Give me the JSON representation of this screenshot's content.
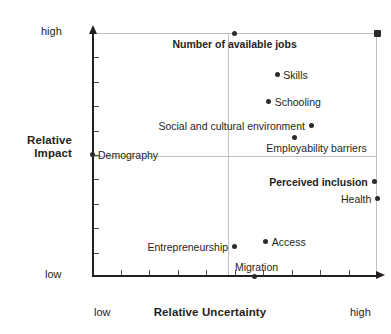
{
  "chart_data": {
    "type": "scatter",
    "title": "",
    "xlabel": "Relative Uncertainty",
    "ylabel": "Relative Impact",
    "xlim": [
      0,
      100
    ],
    "ylim": [
      0,
      100
    ],
    "x_tick_labels": [
      "low",
      "high"
    ],
    "y_tick_labels": [
      "low",
      "high"
    ],
    "grid": "quadrant-midlines",
    "legend": "none",
    "points": [
      {
        "label": "Number of available jobs",
        "x": 50,
        "y": 100,
        "bold": true,
        "label_pos": "below-center",
        "marker": "dot"
      },
      {
        "label": "",
        "x": 100,
        "y": 100,
        "bold": false,
        "label_pos": "none",
        "marker": "square"
      },
      {
        "label": "Skills",
        "x": 65,
        "y": 83,
        "bold": false,
        "label_pos": "right",
        "marker": "dot"
      },
      {
        "label": "Schooling",
        "x": 62,
        "y": 72,
        "bold": false,
        "label_pos": "right",
        "marker": "dot"
      },
      {
        "label": "Social and cultural environment",
        "x": 77,
        "y": 62,
        "bold": false,
        "label_pos": "left",
        "marker": "dot"
      },
      {
        "label": "Employability barriers",
        "x": 71,
        "y": 57,
        "bold": false,
        "label_pos": "below-right",
        "marker": "dot"
      },
      {
        "label": "Demography",
        "x": 0,
        "y": 50,
        "bold": false,
        "label_pos": "right",
        "marker": "dot"
      },
      {
        "label": "Perceived inclusion",
        "x": 99,
        "y": 39,
        "bold": true,
        "label_pos": "left",
        "marker": "dot"
      },
      {
        "label": "Health",
        "x": 100,
        "y": 32,
        "bold": false,
        "label_pos": "left",
        "marker": "dot"
      },
      {
        "label": "Entrepreneurship",
        "x": 50,
        "y": 12,
        "bold": false,
        "label_pos": "left",
        "marker": "dot"
      },
      {
        "label": "Access",
        "x": 61,
        "y": 14,
        "bold": false,
        "label_pos": "right",
        "marker": "dot"
      },
      {
        "label": "Migration",
        "x": 57,
        "y": 0,
        "bold": false,
        "label_pos": "above",
        "marker": "dot"
      }
    ]
  },
  "axes": {
    "y_title_line1": "Relative",
    "y_title_line2": "Impact",
    "x_title": "Relative Uncertainty",
    "y_high": "high",
    "y_low": "low",
    "x_low": "low",
    "x_high": "high"
  },
  "labels": {
    "jobs": "Number of available jobs",
    "skills": "Skills",
    "schooling": "Schooling",
    "social": "Social and cultural environment",
    "employability": "Employability barriers",
    "demography": "Demography",
    "inclusion": "Perceived inclusion",
    "health": "Health",
    "entrepreneurship": "Entrepreneurship",
    "access": "Access",
    "migration": "Migration"
  },
  "colors": {
    "marker": "#2b2b2b",
    "axis": "#231f20",
    "grid": "#bfbfbf",
    "text": "#231f20",
    "background": "#ffffff"
  }
}
